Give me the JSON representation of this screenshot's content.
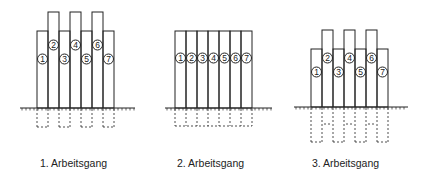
{
  "diagram": {
    "stroke_color": "#222222",
    "background": "#ffffff",
    "panels": [
      {
        "caption": "1. Arbeitsgang",
        "caption_x": 40,
        "ground": {
          "y": 108,
          "x1": 20,
          "x2": 135
        },
        "bar_width": 11,
        "bars": [
          {
            "n": "1",
            "x": 37,
            "top": 31,
            "circle_y": 59
          },
          {
            "n": "2",
            "x": 48,
            "top": 12,
            "circle_y": 45
          },
          {
            "n": "3",
            "x": 59,
            "top": 31,
            "circle_y": 59
          },
          {
            "n": "4",
            "x": 70,
            "top": 12,
            "circle_y": 45
          },
          {
            "n": "5",
            "x": 81,
            "top": 31,
            "circle_y": 59
          },
          {
            "n": "6",
            "x": 92,
            "top": 12,
            "circle_y": 45
          },
          {
            "n": "7",
            "x": 103,
            "top": 31,
            "circle_y": 59
          }
        ],
        "foundation": {
          "bottom": 127,
          "groups": [
            [
              37,
              48
            ],
            [
              59,
              70
            ],
            [
              81,
              92
            ],
            [
              103,
              115
            ]
          ]
        }
      },
      {
        "caption": "2. Arbeitsgang",
        "caption_x": 177,
        "ground": {
          "y": 108,
          "x1": 165,
          "x2": 272
        },
        "bar_width": 11,
        "bars": [
          {
            "n": "1",
            "x": 175,
            "top": 31,
            "circle_y": 58
          },
          {
            "n": "2",
            "x": 186,
            "top": 31,
            "circle_y": 58
          },
          {
            "n": "3",
            "x": 197,
            "top": 31,
            "circle_y": 58
          },
          {
            "n": "4",
            "x": 208,
            "top": 31,
            "circle_y": 58
          },
          {
            "n": "5",
            "x": 219,
            "top": 31,
            "circle_y": 58
          },
          {
            "n": "6",
            "x": 230,
            "top": 31,
            "circle_y": 58
          },
          {
            "n": "7",
            "x": 241,
            "top": 31,
            "circle_y": 58
          }
        ],
        "foundation": {
          "bottom": 126,
          "groups": [
            [
              175,
              252
            ]
          ]
        }
      },
      {
        "caption": "3. Arbeitsgang",
        "caption_x": 312,
        "ground": {
          "y": 107,
          "x1": 294,
          "x2": 408
        },
        "bar_width": 11,
        "bars": [
          {
            "n": "1",
            "x": 311,
            "top": 49,
            "circle_y": 72
          },
          {
            "n": "2",
            "x": 322,
            "top": 30,
            "circle_y": 58
          },
          {
            "n": "3",
            "x": 333,
            "top": 49,
            "circle_y": 72
          },
          {
            "n": "4",
            "x": 344,
            "top": 30,
            "circle_y": 58
          },
          {
            "n": "5",
            "x": 355,
            "top": 49,
            "circle_y": 72
          },
          {
            "n": "6",
            "x": 366,
            "top": 30,
            "circle_y": 58
          },
          {
            "n": "7",
            "x": 377,
            "top": 49,
            "circle_y": 72
          }
        ],
        "foundation": {
          "bottom": 142,
          "mid": 124,
          "groups": [
            [
              311,
              322
            ],
            [
              333,
              344
            ],
            [
              355,
              366
            ],
            [
              377,
              389
            ]
          ],
          "mid_groups": [
            [
              322,
              333
            ],
            [
              344,
              355
            ],
            [
              366,
              377
            ]
          ]
        }
      }
    ]
  }
}
